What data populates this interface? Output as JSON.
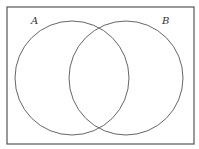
{
  "diagram": {
    "type": "venn",
    "universe": {
      "label": "",
      "x": 7,
      "y": 7,
      "width": 187,
      "height": 137,
      "stroke": "#555555"
    },
    "sets": [
      {
        "label": "A",
        "cx": 72,
        "cy": 78,
        "r": 57,
        "label_x": 31,
        "label_y": 24,
        "stroke": "#666666"
      },
      {
        "label": "B",
        "cx": 126,
        "cy": 78,
        "r": 57,
        "label_x": 162,
        "label_y": 24,
        "stroke": "#666666"
      }
    ]
  }
}
